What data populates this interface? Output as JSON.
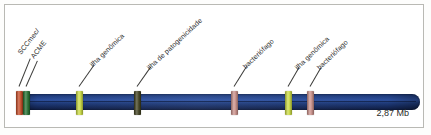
{
  "figure": {
    "size_caption": "2,87 Mb",
    "bar_color": "#25458c"
  },
  "chart_data": {
    "type": "bar",
    "title": "",
    "xlabel": "",
    "ylabel": "",
    "genome_length_label": "2,87 Mb",
    "axis_units": "Mb",
    "xlim": [
      0,
      2.87
    ],
    "grid": false,
    "legend": "none",
    "categories": [
      "SCCmec/",
      "ACME",
      "ilha genômica",
      "ilha de patogenicidade",
      "bacteriófago",
      "ilha genômica",
      "bacteriófago"
    ],
    "values": [
      1,
      1,
      1,
      1,
      1,
      1,
      1
    ],
    "features": [
      {
        "label": "SCCmec/",
        "color": "#c4451f",
        "x_px": 16,
        "leader_len": 30,
        "leader_angle": -68,
        "label_x": 19,
        "label_y": 50,
        "label_angle": -52
      },
      {
        "label": "ACME",
        "color": "#1d6b2a",
        "x_px": 23,
        "leader_len": 28,
        "leader_angle": -66,
        "label_x": 32,
        "label_y": 54,
        "label_angle": -52
      },
      {
        "label": "ilha genômica",
        "color": "#cadb3c",
        "x_px": 76,
        "leader_len": 26,
        "leader_angle": -55,
        "label_x": 91,
        "label_y": 62,
        "label_angle": -44
      },
      {
        "label": "ilha de patogenicidade",
        "color": "#3a3a18",
        "x_px": 134,
        "leader_len": 24,
        "leader_angle": -55,
        "label_x": 148,
        "label_y": 65,
        "label_angle": -43
      },
      {
        "label": "bacteriófago",
        "color": "#c98d86",
        "x_px": 231,
        "leader_len": 24,
        "leader_angle": -58,
        "label_x": 244,
        "label_y": 64,
        "label_angle": -44
      },
      {
        "label": "ilha genômica",
        "color": "#cadb3c",
        "x_px": 285,
        "leader_len": 22,
        "leader_angle": -60,
        "label_x": 296,
        "label_y": 65,
        "label_angle": -44
      },
      {
        "label": "bacteriófago",
        "color": "#c98d86",
        "x_px": 307,
        "leader_len": 22,
        "leader_angle": -60,
        "label_x": 318,
        "label_y": 65,
        "label_angle": -44
      }
    ]
  }
}
